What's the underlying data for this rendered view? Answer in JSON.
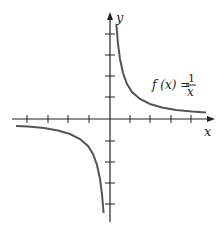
{
  "figure": {
    "x_axis_label": "x",
    "y_axis_label": "y",
    "function_label": {
      "lhs": "f (x) =",
      "numerator": "1",
      "denominator": "x"
    },
    "colors": {
      "axis": "#222222",
      "curve": "#555555",
      "background": "#ffffff"
    },
    "ticks": {
      "x_left_count": 4,
      "x_right_count": 4,
      "y_up_count": 4,
      "y_down_count": 4
    }
  }
}
